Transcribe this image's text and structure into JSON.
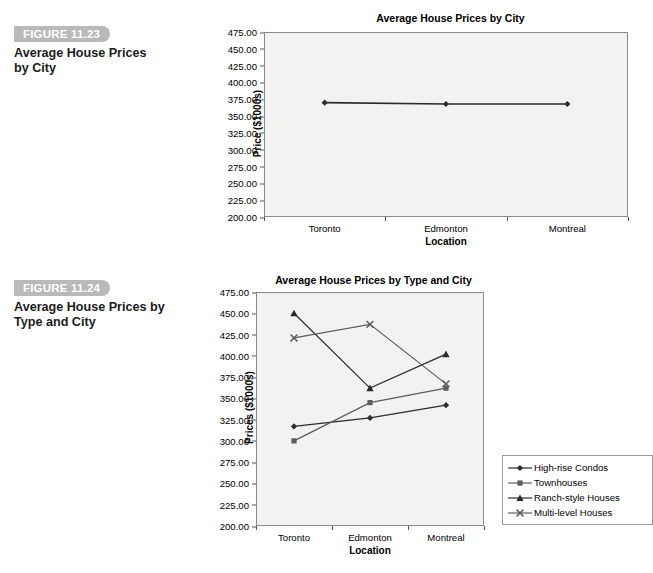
{
  "topnote": "",
  "figures": [
    {
      "tag": "FIGURE 11.23",
      "title_line1": "Average House Prices",
      "title_line2": "by City"
    },
    {
      "tag": "FIGURE 11.24",
      "title_line1": "Average House Prices by",
      "title_line2": "Type and City"
    }
  ],
  "colors": {
    "plot_background": "#f2f2f0",
    "plot_border": "#8a8a8a",
    "series_dark": "#2b2b2b",
    "series_gray": "#5d5d5d",
    "figure_tag_background": "#b9b9b9"
  },
  "chart_data": [
    {
      "type": "line",
      "title": "Average House Prices by City",
      "xlabel": "Location",
      "ylabel": "Price ($1000s)",
      "categories": [
        "Toronto",
        "Edmonton",
        "Montreal"
      ],
      "ylim": [
        200,
        475
      ],
      "yticks": [
        "200.00",
        "225.00",
        "250.00",
        "275.00",
        "300.00",
        "325.00",
        "350.00",
        "375.00",
        "400.00",
        "425.00",
        "450.00",
        "475.00"
      ],
      "grid": false,
      "legend": "none",
      "series": [
        {
          "name": "Average Price",
          "marker": "diamond",
          "color": "#2b2b2b",
          "values": [
            370,
            368,
            368
          ]
        }
      ]
    },
    {
      "type": "line",
      "title": "Average House Prices by Type and City",
      "xlabel": "Location",
      "ylabel": "Prices ($1000s)",
      "categories": [
        "Toronto",
        "Edmonton",
        "Montreal"
      ],
      "ylim": [
        200,
        475
      ],
      "yticks": [
        "200.00",
        "225.00",
        "250.00",
        "275.00",
        "300.00",
        "325.00",
        "350.00",
        "375.00",
        "400.00",
        "425.00",
        "450.00",
        "475.00"
      ],
      "grid": false,
      "legend": "right",
      "series": [
        {
          "name": "High-rise Condos",
          "marker": "diamond",
          "color": "#2b2b2b",
          "values": [
            317,
            327,
            342
          ]
        },
        {
          "name": "Townhouses",
          "marker": "square",
          "color": "#5d5d5d",
          "values": [
            300,
            345,
            362
          ]
        },
        {
          "name": "Ranch-style Houses",
          "marker": "triangle",
          "color": "#2b2b2b",
          "values": [
            450,
            362,
            402
          ]
        },
        {
          "name": "Multi-level Houses",
          "marker": "x",
          "color": "#5d5d5d",
          "values": [
            421,
            437,
            367
          ]
        }
      ]
    }
  ]
}
